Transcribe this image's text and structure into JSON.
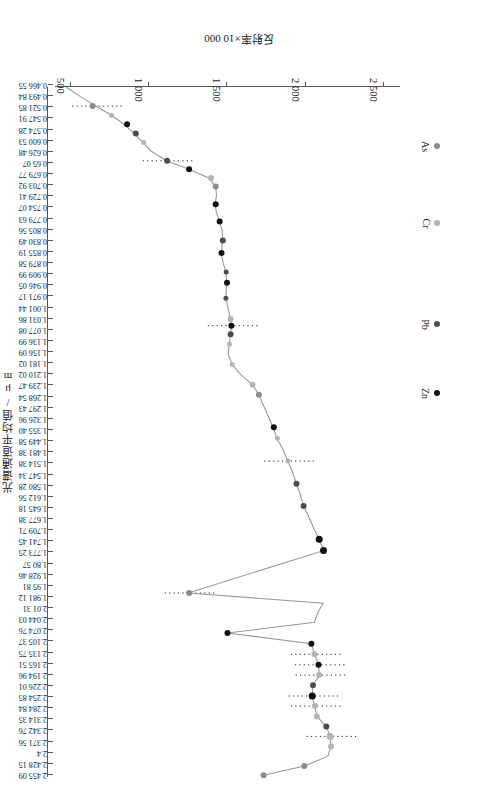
{
  "chart_data": {
    "type": "line",
    "title": "",
    "xlabel": "反射率×10 000",
    "ylabel": "光谱通道平均值/μm",
    "orientation": "rotated-180",
    "grid": false,
    "legend_position": "inside-left",
    "xlim": [
      400,
      2600
    ],
    "xticks": [
      2500,
      2000,
      1500,
      1000,
      500
    ],
    "xtick_labels": [
      "2 500",
      "2 000",
      "1 500",
      "1 000",
      "500"
    ],
    "x_axis_direction": "decreasing-left-to-right",
    "ylim": [
      0.46655,
      2.46
    ],
    "ytick_labels": [
      "0.466 55",
      "0.493 84",
      "0.521 85",
      "0.547 91",
      "0.574 28",
      "0.600 53",
      "0.626 48",
      "0.65 07",
      "0.679 77",
      "0.703 92",
      "0.729 41",
      "0.754 07",
      "0.779 63",
      "0.805 56",
      "0.830 49",
      "0.855 19",
      "0.879 58",
      "0.909 99",
      "0.946 05",
      "0.971 17",
      "1.001 44",
      "1.031 86",
      "1.077 08",
      "1.136 99",
      "1.156 09",
      "1.181 02",
      "1.210 02",
      "1.239 47",
      "1.268 54",
      "1.297 43",
      "1.326 96",
      "1.355 40",
      "1.449 58",
      "1.481 38",
      "1.514 38",
      "1.547 34",
      "1.580 28",
      "1.612 56",
      "1.645 18",
      "1.677 38",
      "1.709 71",
      "1.741 45",
      "1.773 25",
      "1.80 57",
      "1.928 46",
      "1.95 81",
      "1.981 12",
      "2.01 31",
      "2.044 03",
      "2.074 76",
      "2.105 37",
      "2.135 75",
      "2.165 51",
      "2.194 96",
      "2.226 01",
      "2.254 85",
      "2.284 84",
      "2.314 35",
      "2.342 76",
      "2.371 56",
      "2.4",
      "2.428 15",
      "2.455 09"
    ],
    "legend": [
      {
        "name": "As",
        "color": "#8c8c8c"
      },
      {
        "name": "Cr",
        "color": "#b4b4b4"
      },
      {
        "name": "Pb",
        "color": "#4d4d4d"
      },
      {
        "name": "Zn",
        "color": "#111111"
      }
    ],
    "series": [
      {
        "name": "spectral-reflectance-curve",
        "color": "#9a9a9a",
        "points": [
          {
            "wavelength": 0.46655,
            "reflectance": 470
          },
          {
            "wavelength": 0.49384,
            "reflectance": 560
          },
          {
            "wavelength": 0.52185,
            "reflectance": 660
          },
          {
            "wavelength": 0.54791,
            "reflectance": 760
          },
          {
            "wavelength": 0.57428,
            "reflectance": 840
          },
          {
            "wavelength": 0.60053,
            "reflectance": 905
          },
          {
            "wavelength": 0.62648,
            "reflectance": 960
          },
          {
            "wavelength": 0.6507,
            "reflectance": 1010
          },
          {
            "wavelength": 0.67977,
            "reflectance": 1110
          },
          {
            "wavelength": 0.70392,
            "reflectance": 1255
          },
          {
            "wavelength": 0.72941,
            "reflectance": 1380
          },
          {
            "wavelength": 0.75407,
            "reflectance": 1425
          },
          {
            "wavelength": 0.77963,
            "reflectance": 1430
          },
          {
            "wavelength": 0.80556,
            "reflectance": 1420
          },
          {
            "wavelength": 0.83049,
            "reflectance": 1430
          },
          {
            "wavelength": 0.85519,
            "reflectance": 1450
          },
          {
            "wavelength": 0.87958,
            "reflectance": 1465
          },
          {
            "wavelength": 0.90999,
            "reflectance": 1470
          },
          {
            "wavelength": 0.94605,
            "reflectance": 1460
          },
          {
            "wavelength": 0.97117,
            "reflectance": 1470
          },
          {
            "wavelength": 1.00144,
            "reflectance": 1490
          },
          {
            "wavelength": 1.03186,
            "reflectance": 1495
          },
          {
            "wavelength": 1.07708,
            "reflectance": 1490
          },
          {
            "wavelength": 1.13699,
            "reflectance": 1520
          },
          {
            "wavelength": 1.15609,
            "reflectance": 1525
          },
          {
            "wavelength": 1.18102,
            "reflectance": 1520
          },
          {
            "wavelength": 1.21002,
            "reflectance": 1510
          },
          {
            "wavelength": 1.23947,
            "reflectance": 1505
          },
          {
            "wavelength": 1.26854,
            "reflectance": 1530
          },
          {
            "wavelength": 1.29743,
            "reflectance": 1585
          },
          {
            "wavelength": 1.32696,
            "reflectance": 1660
          },
          {
            "wavelength": 1.3554,
            "reflectance": 1700
          },
          {
            "wavelength": 1.44958,
            "reflectance": 1790
          },
          {
            "wavelength": 1.48138,
            "reflectance": 1815
          },
          {
            "wavelength": 1.51438,
            "reflectance": 1855
          },
          {
            "wavelength": 1.54734,
            "reflectance": 1885
          },
          {
            "wavelength": 1.58028,
            "reflectance": 1915
          },
          {
            "wavelength": 1.61256,
            "reflectance": 1940
          },
          {
            "wavelength": 1.64518,
            "reflectance": 1965
          },
          {
            "wavelength": 1.67738,
            "reflectance": 1985
          },
          {
            "wavelength": 1.70971,
            "reflectance": 2020
          },
          {
            "wavelength": 1.74145,
            "reflectance": 2050
          },
          {
            "wavelength": 1.77325,
            "reflectance": 2085
          },
          {
            "wavelength": 1.8057,
            "reflectance": 2115
          },
          {
            "wavelength": 1.92846,
            "reflectance": 1250
          },
          {
            "wavelength": 1.9581,
            "reflectance": 2110
          },
          {
            "wavelength": 1.98112,
            "reflectance": 2080
          },
          {
            "wavelength": 2.0131,
            "reflectance": 2055
          },
          {
            "wavelength": 2.04403,
            "reflectance": 1500
          },
          {
            "wavelength": 2.07476,
            "reflectance": 2035
          },
          {
            "wavelength": 2.10537,
            "reflectance": 2055
          },
          {
            "wavelength": 2.13575,
            "reflectance": 2080
          },
          {
            "wavelength": 2.16551,
            "reflectance": 2085
          },
          {
            "wavelength": 2.19496,
            "reflectance": 2045
          },
          {
            "wavelength": 2.22601,
            "reflectance": 2040
          },
          {
            "wavelength": 2.25485,
            "reflectance": 2055
          },
          {
            "wavelength": 2.28484,
            "reflectance": 2070
          },
          {
            "wavelength": 2.31435,
            "reflectance": 2130
          },
          {
            "wavelength": 2.34276,
            "reflectance": 2155
          },
          {
            "wavelength": 2.37156,
            "reflectance": 2160
          },
          {
            "wavelength": 2.4,
            "reflectance": 2140
          },
          {
            "wavelength": 2.42815,
            "reflectance": 1990
          },
          {
            "wavelength": 2.45509,
            "reflectance": 1730
          }
        ]
      }
    ],
    "marked_points": [
      {
        "element": "As",
        "wavelength": 0.52185,
        "reflectance": 640,
        "color": "#8c8c8c",
        "size": 6
      },
      {
        "element": "Cr",
        "wavelength": 0.54791,
        "reflectance": 760,
        "color": "#b4b4b4",
        "size": 5
      },
      {
        "element": "Zn",
        "wavelength": 0.57428,
        "reflectance": 860,
        "color": "#111111",
        "size": 6
      },
      {
        "element": "Pb",
        "wavelength": 0.60053,
        "reflectance": 915,
        "color": "#4d4d4d",
        "size": 6
      },
      {
        "element": "Cr",
        "wavelength": 0.62648,
        "reflectance": 965,
        "color": "#b4b4b4",
        "size": 5
      },
      {
        "element": "Pb",
        "wavelength": 0.67977,
        "reflectance": 1115,
        "color": "#4d4d4d",
        "size": 6
      },
      {
        "element": "Zn",
        "wavelength": 0.70392,
        "reflectance": 1255,
        "color": "#111111",
        "size": 6
      },
      {
        "element": "Cr",
        "wavelength": 0.72941,
        "reflectance": 1395,
        "color": "#b4b4b4",
        "size": 6
      },
      {
        "element": "As",
        "wavelength": 0.75407,
        "reflectance": 1425,
        "color": "#8c8c8c",
        "size": 6
      },
      {
        "element": "Zn",
        "wavelength": 0.80556,
        "reflectance": 1425,
        "color": "#111111",
        "size": 6
      },
      {
        "element": "Zn",
        "wavelength": 0.85519,
        "reflectance": 1450,
        "color": "#111111",
        "size": 6
      },
      {
        "element": "Pb",
        "wavelength": 0.90999,
        "reflectance": 1470,
        "color": "#4d4d4d",
        "size": 6
      },
      {
        "element": "Zn",
        "wavelength": 0.94605,
        "reflectance": 1462,
        "color": "#111111",
        "size": 6
      },
      {
        "element": "Pb",
        "wavelength": 1.00144,
        "reflectance": 1492,
        "color": "#4d4d4d",
        "size": 5
      },
      {
        "element": "Zn",
        "wavelength": 1.03186,
        "reflectance": 1497,
        "color": "#111111",
        "size": 6
      },
      {
        "element": "Pb",
        "wavelength": 1.07708,
        "reflectance": 1490,
        "color": "#4d4d4d",
        "size": 5
      },
      {
        "element": "Cr",
        "wavelength": 1.13699,
        "reflectance": 1520,
        "color": "#b4b4b4",
        "size": 6
      },
      {
        "element": "Zn",
        "wavelength": 1.15609,
        "reflectance": 1525,
        "color": "#111111",
        "size": 6
      },
      {
        "element": "Pb",
        "wavelength": 1.18102,
        "reflectance": 1520,
        "color": "#4d4d4d",
        "size": 6
      },
      {
        "element": "Cr",
        "wavelength": 1.21002,
        "reflectance": 1512,
        "color": "#b4b4b4",
        "size": 5
      },
      {
        "element": "Cr",
        "wavelength": 1.26854,
        "reflectance": 1530,
        "color": "#b4b4b4",
        "size": 5
      },
      {
        "element": "Cr",
        "wavelength": 1.32696,
        "reflectance": 1660,
        "color": "#b4b4b4",
        "size": 6
      },
      {
        "element": "As",
        "wavelength": 1.3554,
        "reflectance": 1700,
        "color": "#8c8c8c",
        "size": 6
      },
      {
        "element": "Zn",
        "wavelength": 1.44958,
        "reflectance": 1795,
        "color": "#111111",
        "size": 6
      },
      {
        "element": "Cr",
        "wavelength": 1.48138,
        "reflectance": 1818,
        "color": "#b4b4b4",
        "size": 5
      },
      {
        "element": "Cr",
        "wavelength": 1.54734,
        "reflectance": 1885,
        "color": "#b4b4b4",
        "size": 5
      },
      {
        "element": "Pb",
        "wavelength": 1.61256,
        "reflectance": 1940,
        "color": "#4d4d4d",
        "size": 6
      },
      {
        "element": "Pb",
        "wavelength": 1.67738,
        "reflectance": 1985,
        "color": "#4d4d4d",
        "size": 6
      },
      {
        "element": "Zn",
        "wavelength": 1.77325,
        "reflectance": 2085,
        "color": "#111111",
        "size": 7
      },
      {
        "element": "Zn",
        "wavelength": 1.8057,
        "reflectance": 2112,
        "color": "#111111",
        "size": 7
      },
      {
        "element": "As",
        "wavelength": 1.92846,
        "reflectance": 1255,
        "color": "#8c8c8c",
        "size": 6
      },
      {
        "element": "Zn",
        "wavelength": 2.04403,
        "reflectance": 1500,
        "color": "#111111",
        "size": 6
      },
      {
        "element": "Zn",
        "wavelength": 2.07476,
        "reflectance": 2035,
        "color": "#111111",
        "size": 6
      },
      {
        "element": "Cr",
        "wavelength": 2.10537,
        "reflectance": 2055,
        "color": "#b4b4b4",
        "size": 6
      },
      {
        "element": "Zn",
        "wavelength": 2.13575,
        "reflectance": 2080,
        "color": "#111111",
        "size": 6
      },
      {
        "element": "Cr",
        "wavelength": 2.16551,
        "reflectance": 2085,
        "color": "#b4b4b4",
        "size": 6
      },
      {
        "element": "Pb",
        "wavelength": 2.19496,
        "reflectance": 2045,
        "color": "#4d4d4d",
        "size": 6
      },
      {
        "element": "Zn",
        "wavelength": 2.22601,
        "reflectance": 2040,
        "color": "#111111",
        "size": 7
      },
      {
        "element": "Cr",
        "wavelength": 2.25485,
        "reflectance": 2058,
        "color": "#b4b4b4",
        "size": 6
      },
      {
        "element": "Cr",
        "wavelength": 2.28484,
        "reflectance": 2070,
        "color": "#b4b4b4",
        "size": 6
      },
      {
        "element": "Pb",
        "wavelength": 2.31435,
        "reflectance": 2130,
        "color": "#4d4d4d",
        "size": 6
      },
      {
        "element": "Cr",
        "wavelength": 2.34276,
        "reflectance": 2155,
        "color": "#b4b4b4",
        "size": 7
      },
      {
        "element": "Cr",
        "wavelength": 2.37156,
        "reflectance": 2160,
        "color": "#b4b4b4",
        "size": 6
      },
      {
        "element": "As",
        "wavelength": 2.42815,
        "reflectance": 1990,
        "color": "#8c8c8c",
        "size": 6
      },
      {
        "element": "As",
        "wavelength": 2.45509,
        "reflectance": 1730,
        "color": "#8c8c8c",
        "size": 6
      }
    ],
    "annotation_lines": [
      {
        "wavelength": 0.52185,
        "note": "dotted horizontal marker"
      },
      {
        "wavelength": 0.67977,
        "note": "dotted horizontal marker"
      },
      {
        "wavelength": 1.15609,
        "note": "dotted horizontal marker"
      },
      {
        "wavelength": 1.54734,
        "note": "dotted horizontal marker"
      },
      {
        "wavelength": 1.92846,
        "note": "dotted horizontal marker"
      },
      {
        "wavelength": 2.10537,
        "note": "dotted horizontal marker"
      },
      {
        "wavelength": 2.13575,
        "note": "dotted horizontal marker"
      },
      {
        "wavelength": 2.16551,
        "note": "dotted horizontal marker"
      },
      {
        "wavelength": 2.22601,
        "note": "dotted horizontal marker"
      },
      {
        "wavelength": 2.25485,
        "note": "dotted horizontal marker"
      },
      {
        "wavelength": 2.34276,
        "note": "dotted horizontal marker"
      }
    ]
  },
  "axes": {
    "x_title": "反射率×10 000",
    "y_title": "光谱通道平均值/μm"
  },
  "legend": {
    "items": [
      {
        "label": "As",
        "color": "#8c8c8c"
      },
      {
        "label": "Cr",
        "color": "#b4b4b4"
      },
      {
        "label": "Pb",
        "color": "#4d4d4d"
      },
      {
        "label": "Zn",
        "color": "#111111"
      }
    ]
  }
}
